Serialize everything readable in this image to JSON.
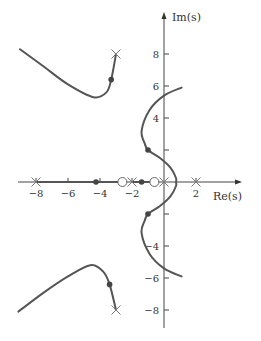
{
  "chart_data": {
    "type": "line",
    "title": "",
    "subtitle": "Root locus",
    "xlabel": "Re(s)",
    "ylabel": "Im(s)",
    "xlim": [
      -10,
      4.5
    ],
    "ylim": [
      -9.6,
      10.3
    ],
    "grid": false,
    "x_ticks": [
      -8,
      -6,
      -4,
      -2,
      2
    ],
    "x_tick_labels": [
      "−8",
      "−6",
      "−4",
      "−2",
      "2"
    ],
    "y_ticks": [
      8,
      6,
      4,
      2,
      -2,
      -4,
      -6,
      -8
    ],
    "y_tick_labels": [
      "8",
      "6",
      "4",
      "",
      "",
      "−4",
      "−6",
      "−8"
    ],
    "poles": [
      {
        "re": -8,
        "im": 0
      },
      {
        "re": -2,
        "im": 0
      },
      {
        "re": 0,
        "im": 0
      },
      {
        "re": 2,
        "im": 0
      },
      {
        "re": -3,
        "im": 8
      },
      {
        "re": -3,
        "im": -8
      }
    ],
    "zeros": [
      {
        "re": -2.6,
        "im": 0
      },
      {
        "re": -0.6,
        "im": 0
      }
    ],
    "marked_points": [
      {
        "re": -4.25,
        "im": 0
      },
      {
        "re": -1.4,
        "im": 0
      },
      {
        "re": -1.0,
        "im": 2
      },
      {
        "re": -1.0,
        "im": -2
      },
      {
        "re": -3.3,
        "im": 6.4
      },
      {
        "re": -3.4,
        "im": -6.4
      }
    ],
    "real_axis_locus": [
      [
        -8,
        -2.6
      ],
      [
        -2,
        -0.6
      ]
    ],
    "series": [
      {
        "name": "upper-left branch",
        "points": [
          [
            -9.0,
            8.3
          ],
          [
            -7.5,
            7.2
          ],
          [
            -6.0,
            6.1
          ],
          [
            -4.4,
            5.3
          ],
          [
            -3.6,
            5.6
          ],
          [
            -3.3,
            6.4
          ],
          [
            -3.0,
            8.0
          ]
        ]
      },
      {
        "name": "lower-left branch",
        "points": [
          [
            -9.1,
            -8.1
          ],
          [
            -7.5,
            -6.9
          ],
          [
            -6.0,
            -5.9
          ],
          [
            -4.6,
            -5.2
          ],
          [
            -3.8,
            -5.6
          ],
          [
            -3.4,
            -6.4
          ],
          [
            -3.0,
            -8.0
          ]
        ]
      },
      {
        "name": "central S-branch",
        "points": [
          [
            1.1,
            5.9
          ],
          [
            0,
            5.4
          ],
          [
            -0.9,
            4.5
          ],
          [
            -1.4,
            3.2
          ],
          [
            -1.2,
            2.4
          ],
          [
            -1.0,
            2.0
          ],
          [
            -0.25,
            1.5
          ],
          [
            0.4,
            0.9
          ],
          [
            0.75,
            0.25
          ],
          [
            0.75,
            0
          ],
          [
            0.75,
            -0.25
          ],
          [
            0.4,
            -0.9
          ],
          [
            -0.25,
            -1.5
          ],
          [
            -1.0,
            -2.0
          ],
          [
            -1.2,
            -2.4
          ],
          [
            -1.4,
            -3.2
          ],
          [
            -0.9,
            -4.5
          ],
          [
            0,
            -5.4
          ],
          [
            1.1,
            -5.9
          ]
        ]
      }
    ]
  },
  "labels": {
    "x_axis": "Re(s)",
    "y_axis": "Im(s)"
  }
}
